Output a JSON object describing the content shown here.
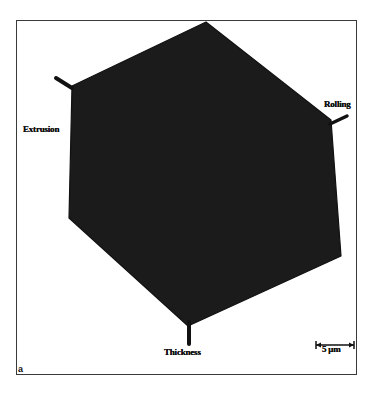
{
  "figure": {
    "panel_label": "a",
    "grain_color": "#1b1b1b",
    "frame_color": "#3a3a3a",
    "background_color": "#ffffff",
    "axes": {
      "extrusion": "Extrusion",
      "rolling": "Rolling",
      "thickness": "Thickness"
    },
    "scale_bar": {
      "label": "5 μm"
    },
    "grain_shape": "hexagon",
    "grain_vertices": [
      [
        206,
        22
      ],
      [
        331,
        120
      ],
      [
        341,
        256
      ],
      [
        188,
        326
      ],
      [
        69,
        218
      ],
      [
        72,
        86
      ]
    ]
  }
}
